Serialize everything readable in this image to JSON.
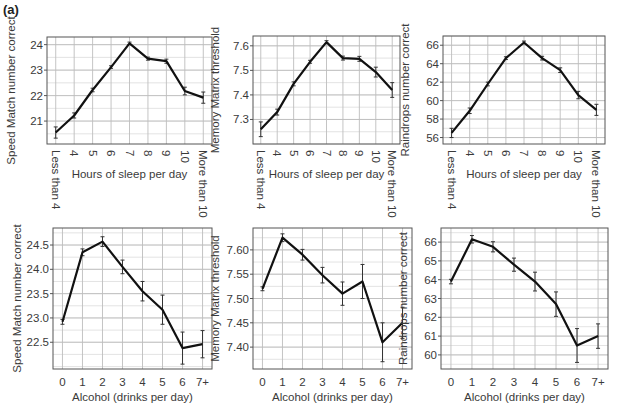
{
  "figure": {
    "panel_label": "(a)"
  },
  "style": {
    "line_color": "#111111",
    "grid_major": "#bdbdbd",
    "grid_minor": "#dcdcdc",
    "frame_color": "#555555",
    "text_color": "#3a3a3a"
  },
  "chart_data": [
    {
      "id": "sleep-speed-match",
      "type": "line",
      "title": "",
      "xlabel": "Hours of sleep per day",
      "ylabel": "Speed Match number correct",
      "categories": [
        "Less than 4",
        "4",
        "5",
        "6",
        "7",
        "8",
        "9",
        "10",
        "More than 10"
      ],
      "values": [
        20.55,
        21.22,
        22.22,
        23.12,
        24.05,
        23.45,
        23.35,
        22.18,
        21.92
      ],
      "errors": [
        0.22,
        0.1,
        0.07,
        0.05,
        0.05,
        0.06,
        0.08,
        0.15,
        0.22
      ],
      "yticks": [
        21,
        22,
        23,
        24
      ],
      "ylim": [
        20.1,
        24.3
      ],
      "grid": true,
      "x_tick_rotation": 90
    },
    {
      "id": "sleep-memory-matrix",
      "type": "line",
      "title": "",
      "xlabel": "Hours of sleep per day",
      "ylabel": "Memory Matrix threshold",
      "categories": [
        "Less than 4",
        "4",
        "5",
        "6",
        "7",
        "8",
        "9",
        "10",
        "More than 10"
      ],
      "values": [
        7.26,
        7.33,
        7.445,
        7.535,
        7.615,
        7.55,
        7.547,
        7.493,
        7.42
      ],
      "errors": [
        0.03,
        0.012,
        0.008,
        0.006,
        0.006,
        0.008,
        0.01,
        0.02,
        0.03
      ],
      "yticks": [
        7.3,
        7.4,
        7.5,
        7.6
      ],
      "yticklabels": [
        "7.3",
        "7.4",
        "7.5",
        "7.6"
      ],
      "ylim": [
        7.2,
        7.64
      ],
      "grid": true,
      "x_tick_rotation": 90
    },
    {
      "id": "sleep-raindrops",
      "type": "line",
      "title": "",
      "xlabel": "Hours of sleep per day",
      "ylabel": "Raindrops number correct",
      "categories": [
        "Less than 4",
        "4",
        "5",
        "6",
        "7",
        "8",
        "9",
        "10",
        "More than 10"
      ],
      "values": [
        56.5,
        58.9,
        61.8,
        64.6,
        66.3,
        64.6,
        63.3,
        60.6,
        59.0
      ],
      "errors": [
        0.5,
        0.3,
        0.2,
        0.15,
        0.15,
        0.2,
        0.25,
        0.4,
        0.6
      ],
      "yticks": [
        56,
        58,
        60,
        62,
        64,
        66
      ],
      "ylim": [
        55.3,
        67.0
      ],
      "grid": true,
      "x_tick_rotation": 90
    },
    {
      "id": "alcohol-speed-match",
      "type": "line",
      "title": "",
      "xlabel": "Alcohol (drinks per day)",
      "ylabel": "Speed Match number correct",
      "categories": [
        "0",
        "1",
        "2",
        "3",
        "4",
        "5",
        "6",
        "7+"
      ],
      "values": [
        22.92,
        24.35,
        24.57,
        24.05,
        23.55,
        23.17,
        22.38,
        22.46
      ],
      "errors": [
        0.05,
        0.07,
        0.1,
        0.14,
        0.2,
        0.3,
        0.33,
        0.28
      ],
      "yticks": [
        22.5,
        23.0,
        23.5,
        24.0,
        24.5
      ],
      "yticklabels": [
        "22.5",
        "23.0",
        "23.5",
        "24.0",
        "24.5"
      ],
      "ylim": [
        21.95,
        24.85
      ],
      "grid": true
    },
    {
      "id": "alcohol-memory-matrix",
      "type": "line",
      "title": "",
      "xlabel": "Alcohol (drinks per day)",
      "ylabel": "Memory Matrix threshold",
      "categories": [
        "0",
        "1",
        "2",
        "3",
        "4",
        "5",
        "6",
        "7+"
      ],
      "values": [
        7.52,
        7.625,
        7.59,
        7.548,
        7.51,
        7.535,
        7.41,
        7.45
      ],
      "errors": [
        0.004,
        0.008,
        0.011,
        0.016,
        0.024,
        0.035,
        0.04,
        0.032
      ],
      "yticks": [
        7.4,
        7.45,
        7.5,
        7.55,
        7.6
      ],
      "yticklabels": [
        "7.40",
        "7.45",
        "7.50",
        "7.55",
        "7.60"
      ],
      "ylim": [
        7.355,
        7.645
      ],
      "grid": true
    },
    {
      "id": "alcohol-raindrops",
      "type": "line",
      "title": "",
      "xlabel": "Alcohol (drinks per day)",
      "ylabel": "Raindrops number correct",
      "categories": [
        "0",
        "1",
        "2",
        "3",
        "4",
        "5",
        "6",
        "7+"
      ],
      "values": [
        63.9,
        66.15,
        65.75,
        64.8,
        63.9,
        62.7,
        60.5,
        61.0
      ],
      "errors": [
        0.12,
        0.2,
        0.27,
        0.35,
        0.5,
        0.65,
        0.9,
        0.65
      ],
      "yticks": [
        60,
        61,
        62,
        63,
        64,
        65,
        66
      ],
      "ylim": [
        59.25,
        66.75
      ],
      "grid": true
    }
  ],
  "layout": [
    {
      "left": 47,
      "top": 37,
      "right": 212,
      "bottom": 144
    },
    {
      "left": 253,
      "top": 36,
      "right": 400,
      "bottom": 144
    },
    {
      "left": 443,
      "top": 36,
      "right": 605,
      "bottom": 144
    },
    {
      "left": 53,
      "top": 228,
      "right": 212,
      "bottom": 369
    },
    {
      "left": 253,
      "top": 228,
      "right": 412,
      "bottom": 369
    },
    {
      "left": 441,
      "top": 228,
      "right": 608,
      "bottom": 369
    }
  ]
}
